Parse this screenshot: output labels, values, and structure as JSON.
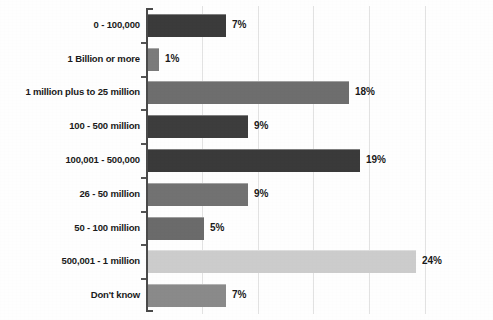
{
  "chart_data": {
    "type": "bar",
    "orientation": "horizontal",
    "title": "",
    "subtitle": "",
    "xlabel": "",
    "ylabel": "",
    "xlim": [
      0,
      30
    ],
    "grid": true,
    "gridline_values": [
      5,
      10,
      15,
      20,
      25
    ],
    "legend": "none",
    "value_suffix": "%",
    "categories": [
      "0 - 100,000",
      "1 Billion or more",
      "1 million plus to 25 million",
      "100 - 500 million",
      "100,001 - 500,000",
      "26 - 50 million",
      "50 - 100 million",
      "500,001 - 1 million",
      "Don't know"
    ],
    "values": [
      7,
      1,
      18,
      9,
      19,
      9,
      5,
      24,
      7
    ],
    "value_labels": [
      "7%",
      "1%",
      "18%",
      "9%",
      "19%",
      "9%",
      "5%",
      "24%",
      "7%"
    ],
    "bar_colors": [
      "#3b3b3b",
      "#7b7b7b",
      "#6e6e6e",
      "#3d3d3d",
      "#3a3a3a",
      "#727272",
      "#6b6b6b",
      "#cccccc",
      "#8a8a8a"
    ]
  },
  "style": {
    "axis_color": "#4a4a4a",
    "gridline_color": "#e2e2e2",
    "text_color": "#1a1a1a",
    "background": "#fefefe"
  }
}
